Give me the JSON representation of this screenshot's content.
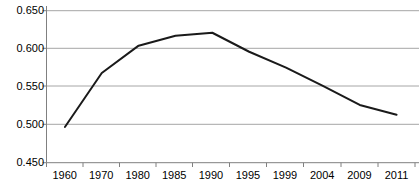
{
  "chart_data": {
    "type": "line",
    "title": "",
    "subtitle": "",
    "xlabel": "",
    "ylabel": "",
    "categories": [
      "1960",
      "1970",
      "1980",
      "1985",
      "1990",
      "1995",
      "1999",
      "2004",
      "2009",
      "2011"
    ],
    "values": [
      0.497,
      0.568,
      0.604,
      0.617,
      0.621,
      0.596,
      0.575,
      0.551,
      0.526,
      0.513
    ],
    "series": [
      {
        "name": "series-1",
        "values": [
          0.497,
          0.568,
          0.604,
          0.617,
          0.621,
          0.596,
          0.575,
          0.551,
          0.526,
          0.513
        ]
      }
    ],
    "ylim": [
      0.45,
      0.65
    ],
    "y_ticks": [
      0.65,
      0.6,
      0.55,
      0.5,
      0.45
    ],
    "y_tick_labels": [
      "0.650",
      "0.600",
      "0.550",
      "0.500",
      "0.450"
    ],
    "x_tick_labels": [
      "1960",
      "1970",
      "1980",
      "1985",
      "1990",
      "1995",
      "1999",
      "2004",
      "2009",
      "2011"
    ],
    "grid": true,
    "grid_axis": "y",
    "legend": false,
    "legend_position": "none",
    "line_color": "#1a1a1a",
    "grid_color": "#a6a6a6",
    "axis_color": "#808080",
    "background_color": "#ffffff",
    "annotations": []
  },
  "axes": {
    "y_labels": [
      "0.650",
      "0.600",
      "0.550",
      "0.500",
      "0.450"
    ],
    "x_labels": [
      "1960",
      "1970",
      "1980",
      "1985",
      "1990",
      "1995",
      "1999",
      "2004",
      "2009",
      "2011"
    ]
  }
}
